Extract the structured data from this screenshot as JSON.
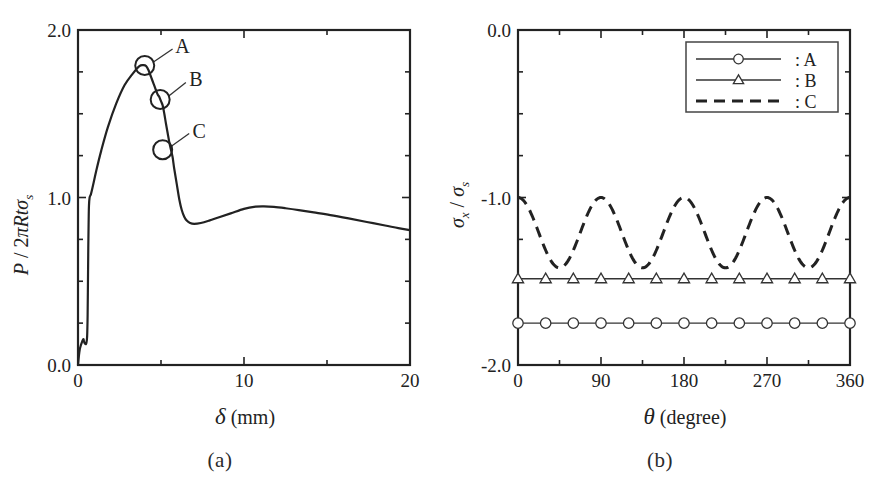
{
  "figure": {
    "panels": [
      {
        "id": "a",
        "caption": "(a)"
      },
      {
        "id": "b",
        "caption": "(b)"
      }
    ]
  },
  "chart_data": [
    {
      "type": "line",
      "panel": "a",
      "title": "",
      "xlabel_parts": {
        "symbol": "δ",
        "unit": "(mm)"
      },
      "ylabel_parts": {
        "numerator": "P",
        "slash": " / ",
        "denominator": "2πRtσ",
        "subscript": "s"
      },
      "xlim": [
        0,
        20
      ],
      "ylim": [
        0.0,
        2.0
      ],
      "xticks": [
        0,
        5,
        10,
        15,
        20
      ],
      "xtick_labels": [
        "0",
        "",
        "10",
        "",
        "20"
      ],
      "yticks": [
        0.0,
        0.25,
        0.5,
        0.75,
        1.0,
        1.25,
        1.5,
        1.75,
        2.0
      ],
      "ytick_labels": [
        "0.0",
        "",
        "",
        "",
        "1.0",
        "",
        "",
        "",
        "2.0"
      ],
      "grid": false,
      "legend": "none",
      "series": [
        {
          "name": "load-displacement",
          "x": [
            0.0,
            0.05,
            0.1,
            0.18,
            0.25,
            0.3,
            0.33,
            0.36,
            0.4,
            0.45,
            0.5,
            0.55,
            0.58,
            0.6,
            0.62,
            0.64,
            0.66,
            0.7,
            0.78,
            0.9,
            1.1,
            1.4,
            1.8,
            2.3,
            2.8,
            3.3,
            3.7,
            3.95,
            4.1,
            4.25,
            4.4,
            4.55,
            4.7,
            4.8,
            4.9,
            5.0,
            5.1,
            5.2,
            5.3,
            5.4,
            5.5,
            5.6,
            5.7,
            5.8,
            5.95,
            6.1,
            6.25,
            6.4,
            6.55,
            6.75,
            7.0,
            7.4,
            7.9,
            8.5,
            9.2,
            10.0,
            10.7,
            11.2,
            11.8,
            12.5,
            13.3,
            14.2,
            15.2,
            16.3,
            17.4,
            18.5,
            19.3,
            20.0
          ],
          "y": [
            0.0,
            0.05,
            0.09,
            0.12,
            0.14,
            0.15,
            0.155,
            0.14,
            0.13,
            0.125,
            0.13,
            0.17,
            0.3,
            0.5,
            0.7,
            0.85,
            0.95,
            1.0,
            1.02,
            1.07,
            1.16,
            1.28,
            1.42,
            1.56,
            1.67,
            1.74,
            1.785,
            1.79,
            1.785,
            1.76,
            1.72,
            1.68,
            1.64,
            1.615,
            1.6,
            1.575,
            1.55,
            1.5,
            1.44,
            1.385,
            1.33,
            1.285,
            1.24,
            1.17,
            1.08,
            0.99,
            0.925,
            0.885,
            0.862,
            0.848,
            0.843,
            0.848,
            0.862,
            0.882,
            0.905,
            0.932,
            0.945,
            0.947,
            0.944,
            0.936,
            0.925,
            0.911,
            0.895,
            0.875,
            0.854,
            0.833,
            0.817,
            0.805
          ]
        }
      ],
      "annotations": [
        {
          "label": "A",
          "point_x": 4.02,
          "point_y": 1.788,
          "label_x": 6.3,
          "label_y": 1.905,
          "marker": "circle-ring"
        },
        {
          "label": "B",
          "point_x": 4.95,
          "point_y": 1.585,
          "label_x": 7.1,
          "label_y": 1.705,
          "marker": "circle-ring"
        },
        {
          "label": "C",
          "point_x": 5.1,
          "point_y": 1.285,
          "label_x": 7.3,
          "label_y": 1.4,
          "marker": "circle-ring"
        }
      ]
    },
    {
      "type": "line",
      "panel": "b",
      "title": "",
      "xlabel_parts": {
        "symbol": "θ",
        "unit": "(degree)"
      },
      "ylabel_parts": {
        "numerator": "σ",
        "numerator_sub": "x",
        "slash": " / ",
        "denominator": "σ",
        "denominator_sub": "s"
      },
      "xlim": [
        0,
        360
      ],
      "ylim": [
        -2.0,
        0.0
      ],
      "xticks": [
        0,
        45,
        90,
        135,
        180,
        225,
        270,
        315,
        360
      ],
      "xtick_labels": [
        "0",
        "",
        "90",
        "",
        "180",
        "",
        "270",
        "",
        "360"
      ],
      "yticks": [
        -2.0,
        -1.75,
        -1.5,
        -1.25,
        -1.0,
        -0.75,
        -0.5,
        -0.25,
        0.0
      ],
      "ytick_labels": [
        "-2.0",
        "",
        "",
        "",
        "-1.0",
        "",
        "",
        "",
        "0.0"
      ],
      "grid": false,
      "legend": "upper-right",
      "series": [
        {
          "name": "A",
          "style": "solid-with-circles",
          "marker": "circle",
          "constant_value": -1.75,
          "marker_x": [
            0,
            30,
            60,
            90,
            120,
            150,
            180,
            210,
            240,
            270,
            300,
            330,
            360
          ],
          "x": [
            0,
            360
          ],
          "y": [
            -1.75,
            -1.75
          ]
        },
        {
          "name": "B",
          "style": "solid-with-triangles",
          "marker": "triangle",
          "constant_value": -1.485,
          "marker_x": [
            0,
            30,
            60,
            90,
            120,
            150,
            180,
            210,
            240,
            270,
            300,
            330,
            360
          ],
          "x": [
            0,
            360
          ],
          "y": [
            -1.485,
            -1.485
          ]
        },
        {
          "name": "C",
          "style": "dashed",
          "marker": "none",
          "formula": "mean + amplitude*cos(4*theta)",
          "mean": -1.21,
          "amplitude": 0.21,
          "period_deg": 90,
          "max_value": -1.0,
          "min_value": -1.42
        }
      ],
      "legend_entries": [
        {
          "label": ": A",
          "style": "solid-with-circles",
          "marker": "circle"
        },
        {
          "label": ": B",
          "style": "solid-with-triangles",
          "marker": "triangle"
        },
        {
          "label": ": C",
          "style": "dashed",
          "marker": "none"
        }
      ]
    }
  ]
}
